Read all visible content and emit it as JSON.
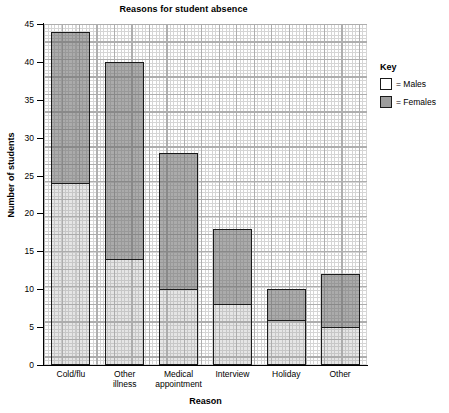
{
  "chart_data": {
    "type": "bar",
    "title": "Reasons for student absence",
    "xlabel": "Reason",
    "ylabel": "Number of students",
    "ylim": [
      0,
      45
    ],
    "ytick_labels": [
      "0",
      "5",
      "10",
      "15",
      "20",
      "25",
      "30",
      "35",
      "40",
      "45"
    ],
    "ytick_values": [
      0,
      5,
      10,
      15,
      20,
      25,
      30,
      35,
      40,
      45
    ],
    "grid": true,
    "stacked": true,
    "legend_position": "right",
    "legend_title": "Key",
    "categories": [
      "Cold/flu",
      "Other illness",
      "Medical appointment",
      "Interview",
      "Holiday",
      "Other"
    ],
    "series": [
      {
        "name": "Males",
        "color": "#ffffff",
        "values": [
          24,
          14,
          10,
          8,
          6,
          5
        ]
      },
      {
        "name": "Females",
        "color": "#9d9d9d",
        "values": [
          20,
          26,
          18,
          10,
          4,
          7
        ]
      }
    ],
    "totals": [
      44,
      40,
      28,
      18,
      10,
      12
    ],
    "legend_entries": [
      {
        "label": "= Males",
        "swatch": "male"
      },
      {
        "label": "= Females",
        "swatch": "female"
      }
    ]
  }
}
